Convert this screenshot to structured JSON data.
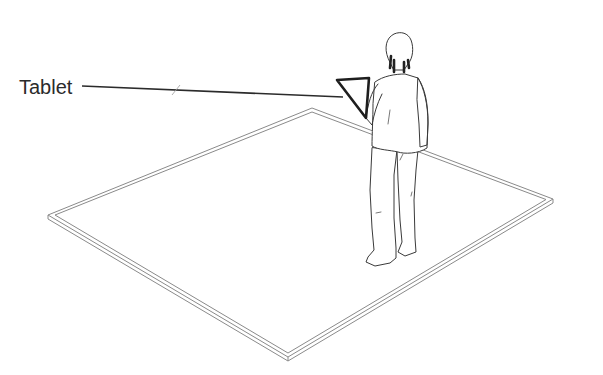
{
  "diagram": {
    "title": "",
    "labels": [
      {
        "id": "tablet",
        "text": "Tablet",
        "target": "tablet held by person"
      }
    ],
    "elements": [
      {
        "id": "floor-area",
        "shape": "parallelogram outline (double line)",
        "corners": [
          [
            312,
            108
          ],
          [
            553,
            199
          ],
          [
            288,
            357
          ],
          [
            48,
            215
          ]
        ]
      },
      {
        "id": "person",
        "shape": "line-drawing of standing person viewed from behind, holding tablet"
      },
      {
        "id": "tablet",
        "shape": "triangle outline (bold)",
        "vertices": [
          [
            337,
            80
          ],
          [
            369,
            78
          ],
          [
            366,
            118
          ]
        ]
      },
      {
        "id": "leader-line",
        "from": [
          82,
          86
        ],
        "to": [
          343,
          97
        ]
      }
    ],
    "colors": {
      "line": "#2b2b2b",
      "floor_line": "#8a8a8a",
      "background": "#ffffff"
    }
  }
}
